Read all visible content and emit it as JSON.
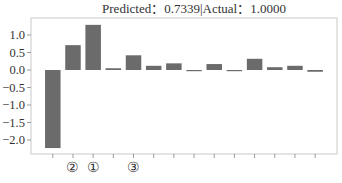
{
  "colors": {
    "bar": "#6b6b6b",
    "axis_box": "#c9c9c9",
    "tick": "#9a9a9a",
    "text": "#333333",
    "background": "#ffffff"
  },
  "chart_data": {
    "type": "bar",
    "title": "Predicted：0.7339|Actual：1.0000",
    "xlabel": "",
    "ylabel": "",
    "categories": [
      "",
      "②",
      "①",
      "",
      "③",
      "",
      "",
      "",
      "",
      "",
      "",
      "",
      "",
      ""
    ],
    "values": [
      -2.23,
      0.71,
      1.29,
      0.05,
      0.42,
      0.12,
      0.19,
      -0.03,
      0.17,
      -0.02,
      0.32,
      0.08,
      0.12,
      -0.05
    ],
    "yticks": [
      1.0,
      0.5,
      0.0,
      -0.5,
      -1.0,
      -1.5,
      -2.0
    ],
    "ytick_labels": [
      "1.0",
      "0.5",
      "0.0",
      "−0.5",
      "−1.0",
      "−1.5",
      "−2.0"
    ],
    "ylim": [
      -2.45,
      1.49
    ],
    "grid": false,
    "legend": null
  }
}
